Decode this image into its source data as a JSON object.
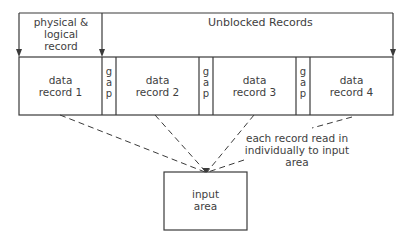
{
  "diagram": {
    "header": {
      "physical_logical_label": "physical & logical record",
      "physical_logical_lines": [
        "physical &",
        "logical",
        "record"
      ],
      "unblocked_label": "Unblocked Records"
    },
    "records": [
      {
        "line1": "data",
        "line2": "record 1"
      },
      {
        "line1": "data",
        "line2": "record 2"
      },
      {
        "line1": "data",
        "line2": "record 3"
      },
      {
        "line1": "data",
        "line2": "record 4"
      }
    ],
    "gaps": [
      {
        "letters": [
          "g",
          "a",
          "p"
        ]
      },
      {
        "letters": [
          "g",
          "a",
          "p"
        ]
      },
      {
        "letters": [
          "g",
          "a",
          "p"
        ]
      }
    ],
    "annotation": {
      "line1": "each record read in",
      "line2": "individually to input area"
    },
    "input_area": {
      "line1": "input",
      "line2": "area"
    },
    "colors": {
      "line": "#3a3a3a",
      "background": "#ffffff"
    }
  }
}
